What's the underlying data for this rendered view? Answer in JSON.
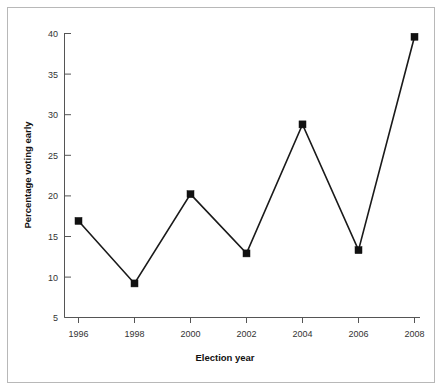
{
  "chart_data": {
    "type": "line",
    "title": "",
    "xlabel": "Election year",
    "ylabel": "Percentage voting early",
    "categories": [
      "1996",
      "1998",
      "2000",
      "2002",
      "2004",
      "2006",
      "2008"
    ],
    "x": [
      1996,
      1998,
      2000,
      2002,
      2004,
      2006,
      2008
    ],
    "values": [
      16.9,
      9.2,
      20.2,
      12.9,
      28.8,
      13.3,
      39.6
    ],
    "series": [
      {
        "name": "Percentage voting early",
        "values": [
          16.9,
          9.2,
          20.2,
          12.9,
          28.8,
          13.3,
          39.6
        ]
      }
    ],
    "xlim": [
      1996,
      2008
    ],
    "ylim": [
      5,
      40
    ],
    "ytick_labels": [
      "40",
      "35",
      "30",
      "25",
      "20",
      "15",
      "10",
      "5"
    ],
    "yticks": [
      40,
      35,
      30,
      25,
      20,
      15,
      10,
      5
    ],
    "xtick_labels": [
      "1996",
      "1998",
      "2000",
      "2002",
      "2004",
      "2006",
      "2008"
    ],
    "grid": false,
    "legend": false,
    "marker": "square",
    "line_color": "#1a1a1a",
    "marker_color": "#111111",
    "axis_color": "#555555",
    "border_color": "#b8b8b8",
    "background_color": "#ffffff"
  },
  "axes": {
    "y_title": "Percentage voting early",
    "x_title": "Election year",
    "y_ticks": [
      {
        "label": "40",
        "value": 40
      },
      {
        "label": "35",
        "value": 35
      },
      {
        "label": "30",
        "value": 30
      },
      {
        "label": "25",
        "value": 25
      },
      {
        "label": "20",
        "value": 20
      },
      {
        "label": "15",
        "value": 15
      },
      {
        "label": "10",
        "value": 10
      },
      {
        "label": "5",
        "value": 5
      }
    ],
    "x_ticks": [
      {
        "label": "1996",
        "value": 1996
      },
      {
        "label": "1998",
        "value": 1998
      },
      {
        "label": "2000",
        "value": 2000
      },
      {
        "label": "2002",
        "value": 2002
      },
      {
        "label": "2004",
        "value": 2004
      },
      {
        "label": "2006",
        "value": 2006
      },
      {
        "label": "2008",
        "value": 2008
      }
    ]
  }
}
